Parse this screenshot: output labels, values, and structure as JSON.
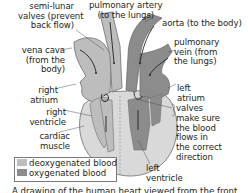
{
  "diagram": {
    "type": "labeled anatomical diagram",
    "subject": "human heart viewed from the front",
    "labels": {
      "semi_lunar_valves": [
        "semi-lunar",
        "valves (prevent",
        "back flow)"
      ],
      "pulmonary_artery": [
        "pulmonary artery",
        "(to the lungs)"
      ],
      "aorta": [
        "aorta (to the body)"
      ],
      "vena_cava": [
        "vena cava",
        "(from the",
        "body)"
      ],
      "pulmonary_vein": [
        "pulmonary",
        "vein (from",
        "the lungs)"
      ],
      "right_atrium": [
        "right",
        "atrium"
      ],
      "left_atrium": [
        "left",
        "atrium"
      ],
      "right_ventricle": [
        "right",
        "ventricle"
      ],
      "valves": [
        "valves",
        "make sure",
        "the blood",
        "flows in",
        "the correct",
        "direction"
      ],
      "cardiac_muscle": [
        "cardiac",
        "muscle"
      ],
      "left_ventricle": [
        "left",
        "ventricle"
      ]
    },
    "legend": [
      {
        "label": "deoxygenated blood",
        "color": "#bdbdbd"
      },
      {
        "label": "oxygenated blood",
        "color": "#8c8c8c"
      }
    ],
    "caption": "A drawing of the human heart viewed from the front"
  },
  "colors": {
    "deoxygenated": "#bdbdbd",
    "oxygenated": "#8c8c8c",
    "muscle": "#d9d9d9",
    "outline": "#6e6e6e",
    "arrow": "#231f20"
  }
}
